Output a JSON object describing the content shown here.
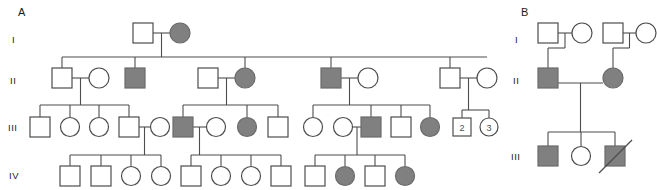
{
  "figure": {
    "width": 657,
    "height": 190,
    "background": "#ffffff",
    "affected_fill": "#808080",
    "unaffected_fill": "#ffffff",
    "line_color": "#4d4d4d"
  },
  "panels": [
    {
      "id": "A",
      "label": "A",
      "label_x": 18,
      "label_y": 14,
      "generation_labels": [
        {
          "text": "I",
          "x": 12,
          "y": 40
        },
        {
          "text": "II",
          "x": 10,
          "y": 81
        },
        {
          "text": "III",
          "x": 8,
          "y": 128
        },
        {
          "text": "IV",
          "x": 9,
          "y": 176
        }
      ],
      "individuals": [
        {
          "id": "A-I-1",
          "gen": "I",
          "sex": "male",
          "affected": false,
          "cx": 143,
          "cy": 33
        },
        {
          "id": "A-I-2",
          "gen": "I",
          "sex": "female",
          "affected": true,
          "cx": 180,
          "cy": 33
        },
        {
          "id": "A-II-1",
          "gen": "II",
          "sex": "male",
          "affected": false,
          "cx": 62,
          "cy": 78
        },
        {
          "id": "A-II-2",
          "gen": "II",
          "sex": "female",
          "affected": false,
          "cx": 99,
          "cy": 78
        },
        {
          "id": "A-II-3",
          "gen": "II",
          "sex": "male",
          "affected": true,
          "cx": 135,
          "cy": 78
        },
        {
          "id": "A-II-4",
          "gen": "II",
          "sex": "male",
          "affected": false,
          "cx": 208,
          "cy": 78
        },
        {
          "id": "A-II-5",
          "gen": "II",
          "sex": "female",
          "affected": true,
          "cx": 245,
          "cy": 78
        },
        {
          "id": "A-II-6",
          "gen": "II",
          "sex": "male",
          "affected": true,
          "cx": 331,
          "cy": 78
        },
        {
          "id": "A-II-7",
          "gen": "II",
          "sex": "female",
          "affected": false,
          "cx": 368,
          "cy": 78
        },
        {
          "id": "A-II-8",
          "gen": "II",
          "sex": "male",
          "affected": false,
          "cx": 450,
          "cy": 78
        },
        {
          "id": "A-II-9",
          "gen": "II",
          "sex": "female",
          "affected": false,
          "cx": 487,
          "cy": 78
        },
        {
          "id": "A-III-1",
          "gen": "III",
          "sex": "male",
          "affected": false,
          "cx": 40,
          "cy": 127
        },
        {
          "id": "A-III-2",
          "gen": "III",
          "sex": "female",
          "affected": false,
          "cx": 70,
          "cy": 127
        },
        {
          "id": "A-III-3",
          "gen": "III",
          "sex": "female",
          "affected": false,
          "cx": 99,
          "cy": 127
        },
        {
          "id": "A-III-4",
          "gen": "III",
          "sex": "male",
          "affected": false,
          "cx": 129,
          "cy": 127
        },
        {
          "id": "A-III-5",
          "gen": "III",
          "sex": "female",
          "affected": false,
          "cx": 160,
          "cy": 127
        },
        {
          "id": "A-III-6",
          "gen": "III",
          "sex": "male",
          "affected": true,
          "cx": 183,
          "cy": 127
        },
        {
          "id": "A-III-7",
          "gen": "III",
          "sex": "female",
          "affected": false,
          "cx": 216,
          "cy": 127
        },
        {
          "id": "A-III-8",
          "gen": "III",
          "sex": "female",
          "affected": true,
          "cx": 247,
          "cy": 127
        },
        {
          "id": "A-III-9",
          "gen": "III",
          "sex": "male",
          "affected": false,
          "cx": 278,
          "cy": 127
        },
        {
          "id": "A-III-10",
          "gen": "III",
          "sex": "female",
          "affected": false,
          "cx": 313,
          "cy": 127
        },
        {
          "id": "A-III-11",
          "gen": "III",
          "sex": "female",
          "affected": false,
          "cx": 343,
          "cy": 127
        },
        {
          "id": "A-III-12",
          "gen": "III",
          "sex": "male",
          "affected": true,
          "cx": 371,
          "cy": 127
        },
        {
          "id": "A-III-13",
          "gen": "III",
          "sex": "male",
          "affected": false,
          "cx": 401,
          "cy": 127
        },
        {
          "id": "A-III-14",
          "gen": "III",
          "sex": "female",
          "affected": true,
          "cx": 430,
          "cy": 127
        },
        {
          "id": "A-III-15",
          "gen": "III",
          "sex": "male",
          "affected": false,
          "cx": 462,
          "cy": 127,
          "count": "2"
        },
        {
          "id": "A-III-16",
          "gen": "III",
          "sex": "female",
          "affected": false,
          "cx": 489,
          "cy": 127,
          "count": "3"
        },
        {
          "id": "A-IV-1",
          "gen": "IV",
          "sex": "male",
          "affected": false,
          "cx": 70,
          "cy": 176
        },
        {
          "id": "A-IV-2",
          "gen": "IV",
          "sex": "male",
          "affected": false,
          "cx": 101,
          "cy": 176
        },
        {
          "id": "A-IV-3",
          "gen": "IV",
          "sex": "female",
          "affected": false,
          "cx": 131,
          "cy": 176
        },
        {
          "id": "A-IV-4",
          "gen": "IV",
          "sex": "female",
          "affected": false,
          "cx": 161,
          "cy": 176
        },
        {
          "id": "A-IV-5",
          "gen": "IV",
          "sex": "male",
          "affected": false,
          "cx": 191,
          "cy": 176
        },
        {
          "id": "A-IV-6",
          "gen": "IV",
          "sex": "female",
          "affected": false,
          "cx": 221,
          "cy": 176
        },
        {
          "id": "A-IV-7",
          "gen": "IV",
          "sex": "female",
          "affected": false,
          "cx": 251,
          "cy": 176
        },
        {
          "id": "A-IV-8",
          "gen": "IV",
          "sex": "male",
          "affected": false,
          "cx": 281,
          "cy": 176
        },
        {
          "id": "A-IV-9",
          "gen": "IV",
          "sex": "male",
          "affected": false,
          "cx": 315,
          "cy": 176
        },
        {
          "id": "A-IV-10",
          "gen": "IV",
          "sex": "female",
          "affected": true,
          "cx": 345,
          "cy": 176
        },
        {
          "id": "A-IV-11",
          "gen": "IV",
          "sex": "male",
          "affected": false,
          "cx": 375,
          "cy": 176
        },
        {
          "id": "A-IV-12",
          "gen": "IV",
          "sex": "female",
          "affected": true,
          "cx": 405,
          "cy": 176
        }
      ]
    },
    {
      "id": "B",
      "label": "B",
      "label_x": 521,
      "label_y": 14,
      "generation_labels": [
        {
          "text": "I",
          "x": 515,
          "y": 40
        },
        {
          "text": "II",
          "x": 513,
          "y": 81
        },
        {
          "text": "III",
          "x": 511,
          "y": 157
        }
      ],
      "individuals": [
        {
          "id": "B-I-1",
          "gen": "I",
          "sex": "male",
          "affected": false,
          "cx": 548,
          "cy": 33
        },
        {
          "id": "B-I-2",
          "gen": "I",
          "sex": "female",
          "affected": false,
          "cx": 582,
          "cy": 33
        },
        {
          "id": "B-I-3",
          "gen": "I",
          "sex": "male",
          "affected": false,
          "cx": 613,
          "cy": 33
        },
        {
          "id": "B-I-4",
          "gen": "I",
          "sex": "female",
          "affected": false,
          "cx": 646,
          "cy": 33
        },
        {
          "id": "B-II-1",
          "gen": "II",
          "sex": "male",
          "affected": true,
          "cx": 548,
          "cy": 78
        },
        {
          "id": "B-II-2",
          "gen": "II",
          "sex": "female",
          "affected": true,
          "cx": 613,
          "cy": 78
        },
        {
          "id": "B-III-1",
          "gen": "III",
          "sex": "male",
          "affected": true,
          "cx": 548,
          "cy": 156
        },
        {
          "id": "B-III-2",
          "gen": "III",
          "sex": "female",
          "affected": false,
          "cx": 581,
          "cy": 156
        },
        {
          "id": "B-III-3",
          "gen": "III",
          "sex": "male",
          "affected": true,
          "cx": 615,
          "cy": 156,
          "deceased": true
        }
      ]
    }
  ],
  "symbol_legend": {
    "male": "square",
    "female": "circle",
    "affected": "filled-gray",
    "unaffected": "open-white",
    "deceased": "diagonal-slash",
    "sibship_count": "number-inside-symbol"
  }
}
